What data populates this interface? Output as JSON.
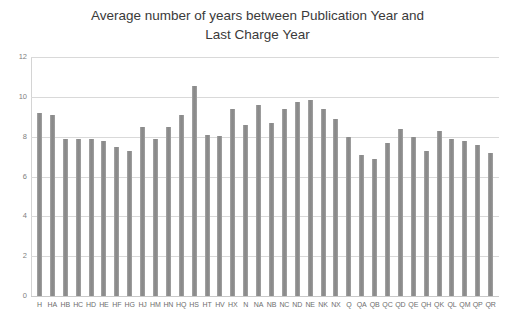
{
  "chart_data": {
    "type": "bar",
    "title_lines": [
      "Average number of years between Publication Year and",
      "Last Charge Year"
    ],
    "xlabel": "",
    "ylabel": "",
    "ylim": [
      0,
      12
    ],
    "y_ticks": [
      0,
      2,
      4,
      6,
      8,
      10,
      12
    ],
    "y_tick_labels": [
      "0",
      "2",
      "4",
      "6",
      "8",
      "10",
      "12"
    ],
    "grid": true,
    "legend": "none",
    "bar_color": "#8f8f8f",
    "categories": [
      "H",
      "HA",
      "HB",
      "HC",
      "HD",
      "HE",
      "HF",
      "HG",
      "HJ",
      "HM",
      "HN",
      "HQ",
      "HS",
      "HT",
      "HV",
      "HX",
      "N",
      "NA",
      "NB",
      "NC",
      "ND",
      "NE",
      "NK",
      "NX",
      "Q",
      "QA",
      "QB",
      "QC",
      "QD",
      "QE",
      "QH",
      "QK",
      "QL",
      "QM",
      "QP",
      "QR"
    ],
    "values": [
      9.2,
      9.1,
      7.9,
      7.9,
      7.9,
      7.8,
      7.5,
      7.3,
      8.5,
      7.9,
      8.5,
      9.1,
      10.55,
      8.1,
      8.05,
      9.4,
      8.6,
      9.6,
      8.7,
      9.4,
      9.75,
      9.85,
      9.4,
      8.9,
      8.0,
      7.1,
      6.9,
      7.7,
      8.4,
      8.0,
      7.3,
      8.3,
      7.9,
      7.8,
      7.6,
      7.2
    ]
  },
  "y_axis": {
    "labels": [
      "12",
      "10",
      "8",
      "6",
      "4",
      "2",
      "0"
    ]
  }
}
